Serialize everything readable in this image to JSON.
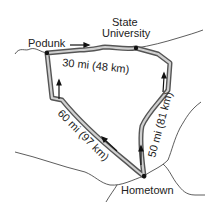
{
  "diagram": {
    "type": "route-map",
    "towns": [
      {
        "id": "podunk",
        "label": "Podunk"
      },
      {
        "id": "state-university",
        "label_line1": "State",
        "label_line2": "University"
      },
      {
        "id": "hometown",
        "label": "Hometown"
      }
    ],
    "legs": [
      {
        "from": "Podunk",
        "to": "State University",
        "label": "30 mi (48 km)"
      },
      {
        "from": "Hometown",
        "to": "State University",
        "label": "50 mi (81 km)"
      },
      {
        "from": "Hometown",
        "to": "Podunk",
        "label": "60 mi (97 km)"
      }
    ],
    "colors": {
      "route_outer": "#555555",
      "route_inner": "#cfcfcf",
      "road": "#333333",
      "text": "#222222"
    }
  }
}
